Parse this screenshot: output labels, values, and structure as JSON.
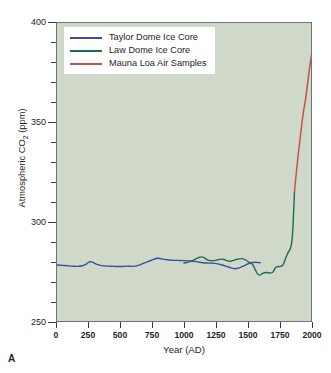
{
  "panel": {
    "label": "A"
  },
  "chart_data": {
    "type": "line",
    "title": "",
    "xlabel": "Year (AD)",
    "ylabel": "Atmospheric CO2 (ppm)",
    "ylabel_rich": {
      "prefix": "Atmospheric CO",
      "sub": "2",
      "suffix": " (ppm)"
    },
    "xlim": [
      0,
      2000
    ],
    "ylim": [
      250,
      400
    ],
    "xticks": [
      0,
      250,
      500,
      750,
      1000,
      1250,
      1500,
      1750,
      2000
    ],
    "xtick_labels": [
      "0",
      "250",
      "500",
      "750",
      "1000",
      "1250",
      "1500",
      "1750",
      "2000"
    ],
    "yticks": [
      250,
      300,
      350,
      400
    ],
    "ytick_labels": [
      "250",
      "300",
      "350",
      "400"
    ],
    "yticks_minor": [
      260,
      270,
      280,
      290,
      310,
      320,
      330,
      340,
      360,
      370,
      380,
      390
    ],
    "grid": false,
    "legend_position": "upper-left",
    "plot_background": "#cfd8c9",
    "series": [
      {
        "name": "Taylor Dome Ice Core",
        "color": "#3a4f9e",
        "x": [
          0,
          40,
          80,
          120,
          160,
          200,
          230,
          255,
          280,
          310,
          350,
          400,
          450,
          500,
          550,
          600,
          640,
          680,
          720,
          760,
          790,
          820,
          860,
          900,
          950,
          1000,
          1060,
          1120,
          1180,
          1240,
          1300,
          1350,
          1400,
          1440,
          1480,
          1520,
          1560,
          1600
        ],
        "values": [
          278.2,
          278.0,
          277.8,
          277.6,
          277.5,
          277.8,
          278.6,
          279.8,
          279.6,
          278.6,
          277.9,
          277.6,
          277.5,
          277.4,
          277.6,
          277.5,
          278.0,
          279.0,
          280.0,
          281.0,
          281.6,
          281.3,
          280.9,
          280.6,
          280.5,
          280.4,
          280.2,
          279.6,
          279.2,
          279.0,
          278.2,
          277.2,
          276.3,
          276.9,
          278.0,
          279.2,
          279.6,
          279.3
        ]
      },
      {
        "name": "Law Dome Ice Core",
        "color": "#1d6b52",
        "x": [
          1000,
          1040,
          1080,
          1110,
          1140,
          1165,
          1190,
          1220,
          1250,
          1280,
          1310,
          1340,
          1365,
          1390,
          1420,
          1450,
          1480,
          1510,
          1540,
          1560,
          1580,
          1600,
          1620,
          1650,
          1680,
          1700,
          1720,
          1740,
          1760,
          1780,
          1800,
          1820,
          1840,
          1855,
          1870
        ],
        "values": [
          279.2,
          279.8,
          280.8,
          281.8,
          282.3,
          281.6,
          280.6,
          280.3,
          280.5,
          281.0,
          281.1,
          280.3,
          280.1,
          280.5,
          281.1,
          281.4,
          280.9,
          279.7,
          278.4,
          276.0,
          273.6,
          273.2,
          274.0,
          274.4,
          274.2,
          274.6,
          276.8,
          277.4,
          277.5,
          278.2,
          281.5,
          284.5,
          287.0,
          294.0,
          315.0
        ]
      },
      {
        "name": "Mauna Loa Air Samples",
        "color": "#c2544f",
        "x": [
          1870,
          1880,
          1900,
          1920,
          1940,
          1958,
          1970,
          1980,
          1990,
          2000,
          2008
        ],
        "values": [
          315.0,
          322.0,
          334.0,
          345.0,
          355.0,
          362.0,
          368.0,
          373.0,
          378.0,
          382.0,
          385.5
        ]
      }
    ]
  },
  "legend": {
    "entries": [
      {
        "label": "Taylor Dome Ice Core",
        "color": "#3a4f9e"
      },
      {
        "label": "Law Dome Ice Core",
        "color": "#1d6b52"
      },
      {
        "label": "Mauna Loa Air Samples",
        "color": "#c2544f"
      }
    ]
  }
}
